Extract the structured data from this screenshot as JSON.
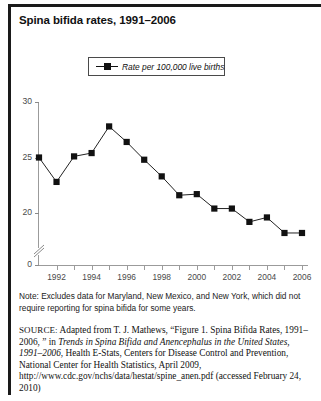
{
  "figure": {
    "title": "Spina bifida rates, 1991–2006",
    "note": "Note: Excludes data for Maryland, New Mexico, and New York, which did not require reporting for spina bifida for some years.",
    "source_label": "SOURCE:",
    "source_part1": " Adapted from T. J. Mathews, “Figure 1. Spina Bifida Rates, 1991–2006, ” in ",
    "source_italic1": "Trends in Spina Bifida and Anencephalus in the United States, 1991–2006",
    "source_part2": ", Health E-Stats, Centers for Disease Control and Prevention, National Center for Health Statistics, April 2009, http://www.cdc.gov/nchs/data/hestat/spine_anen.pdf (accessed February 24, 2010)"
  },
  "legend": {
    "label": "Rate per 100,000 live births",
    "symbol": "line-square-marker"
  },
  "chart_data": {
    "type": "line",
    "title": "Spina bifida rates, 1991–2006",
    "xlabel": "",
    "ylabel": "",
    "series": [
      {
        "name": "Rate per 100,000 live births",
        "values": [
          25.0,
          22.8,
          25.1,
          25.4,
          27.8,
          26.4,
          24.8,
          23.3,
          21.6,
          21.7,
          20.4,
          20.4,
          19.2,
          19.6,
          18.2,
          18.2
        ]
      }
    ],
    "x": [
      1991,
      1992,
      1993,
      1994,
      1995,
      1996,
      1997,
      1998,
      1999,
      2000,
      2001,
      2002,
      2003,
      2004,
      2005,
      2006
    ],
    "xtick_labels": [
      "1992",
      "1994",
      "1996",
      "1998",
      "2000",
      "2002",
      "2004",
      "2006"
    ],
    "xtick_values": [
      1992,
      1994,
      1996,
      1998,
      2000,
      2002,
      2004,
      2006
    ],
    "ytick_labels": [
      "0",
      "20",
      "25",
      "30"
    ],
    "ytick_values": [
      0,
      20,
      25,
      30
    ],
    "ylim": [
      18,
      30
    ],
    "xlim": [
      1991,
      2006
    ],
    "axis_break": true,
    "grid": false,
    "legend_position": "top-center",
    "marker": "square",
    "line_color": "#222222",
    "marker_color": "#111111"
  }
}
